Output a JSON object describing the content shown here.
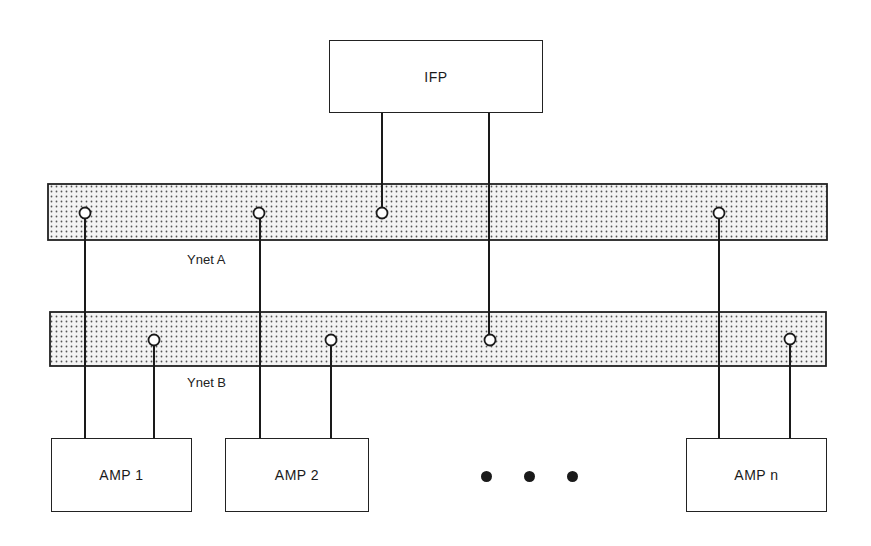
{
  "diagram": {
    "nodes": {
      "ifp": {
        "label": "IFP"
      },
      "amp1": {
        "label": "AMP 1"
      },
      "amp2": {
        "label": "AMP 2"
      },
      "ampn": {
        "label": "AMP n"
      }
    },
    "buses": {
      "ynet_a": {
        "label": "Ynet A"
      },
      "ynet_b": {
        "label": "Ynet B"
      }
    },
    "ellipsis": "• • •",
    "connections": [
      {
        "from": "IFP",
        "to": "Ynet A"
      },
      {
        "from": "IFP",
        "to": "Ynet B"
      },
      {
        "from": "AMP 1",
        "to": "Ynet A"
      },
      {
        "from": "AMP 1",
        "to": "Ynet B"
      },
      {
        "from": "AMP 2",
        "to": "Ynet A"
      },
      {
        "from": "AMP 2",
        "to": "Ynet B"
      },
      {
        "from": "AMP n",
        "to": "Ynet A"
      },
      {
        "from": "AMP n",
        "to": "Ynet B"
      }
    ],
    "colors": {
      "line": "#1a1a1a",
      "bus_fill": "#e6e6e6",
      "bus_dot": "#6a6a6a"
    }
  }
}
